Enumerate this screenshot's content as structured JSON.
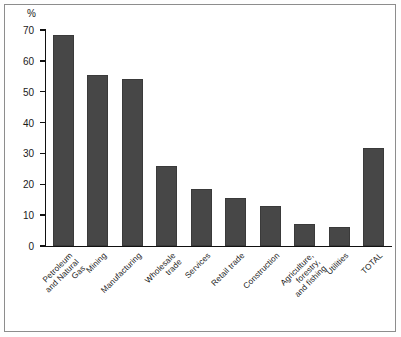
{
  "chart_data": {
    "type": "bar",
    "title": "",
    "subtitle": "",
    "xlabel": "",
    "ylabel": "%",
    "ylim": [
      0,
      70
    ],
    "ytick_step": 10,
    "yticks": [
      0,
      10,
      20,
      30,
      40,
      50,
      60,
      70
    ],
    "grid": false,
    "legend": "none",
    "bar_color": "#474747",
    "background_color": "#ffffff",
    "axis_color": "#111111",
    "categories": [
      "Petroleum\nand Natural Gas",
      "Mining",
      "Manufacturing",
      "Wholesale trade",
      "Services",
      "Retail trade",
      "Construction",
      "Agriculture, forestry,\nand fishing",
      "Utilities",
      "TOTAL"
    ],
    "values": [
      68.5,
      55.5,
      54.0,
      26.0,
      18.5,
      15.5,
      13.0,
      7.0,
      6.0,
      31.7
    ],
    "series": [
      {
        "name": "Share",
        "values": [
          68.5,
          55.5,
          54.0,
          26.0,
          18.5,
          15.5,
          13.0,
          7.0,
          6.0,
          31.7
        ]
      }
    ]
  }
}
